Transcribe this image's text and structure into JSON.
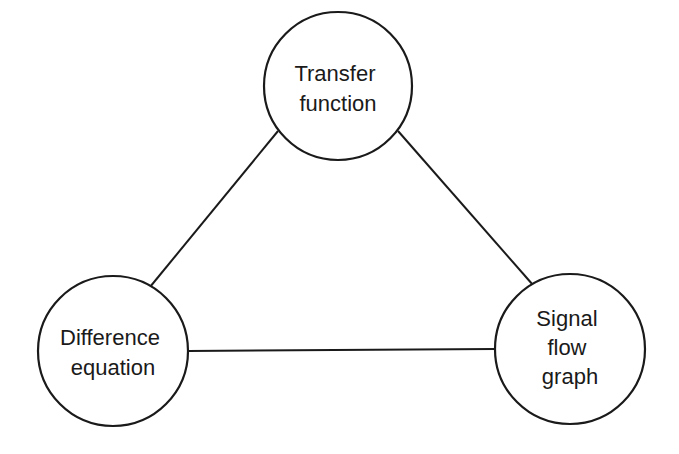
{
  "diagram": {
    "type": "triangle-relationship",
    "colors": {
      "stroke": "#1a1a1a",
      "background": "#ffffff",
      "text": "#1a1a1a"
    },
    "nodes": [
      {
        "id": "transfer-function",
        "lines": [
          "Transfer",
          "function"
        ],
        "cx": 338,
        "cy": 86,
        "r": 74
      },
      {
        "id": "difference-equation",
        "lines": [
          "Difference",
          "equation"
        ],
        "cx": 113,
        "cy": 351,
        "r": 75
      },
      {
        "id": "signal-flow-graph",
        "lines": [
          "Signal",
          "flow",
          "graph"
        ],
        "cx": 570,
        "cy": 349,
        "r": 75
      }
    ],
    "edges": [
      {
        "from": "transfer-function",
        "to": "difference-equation"
      },
      {
        "from": "transfer-function",
        "to": "signal-flow-graph"
      },
      {
        "from": "difference-equation",
        "to": "signal-flow-graph"
      }
    ]
  }
}
